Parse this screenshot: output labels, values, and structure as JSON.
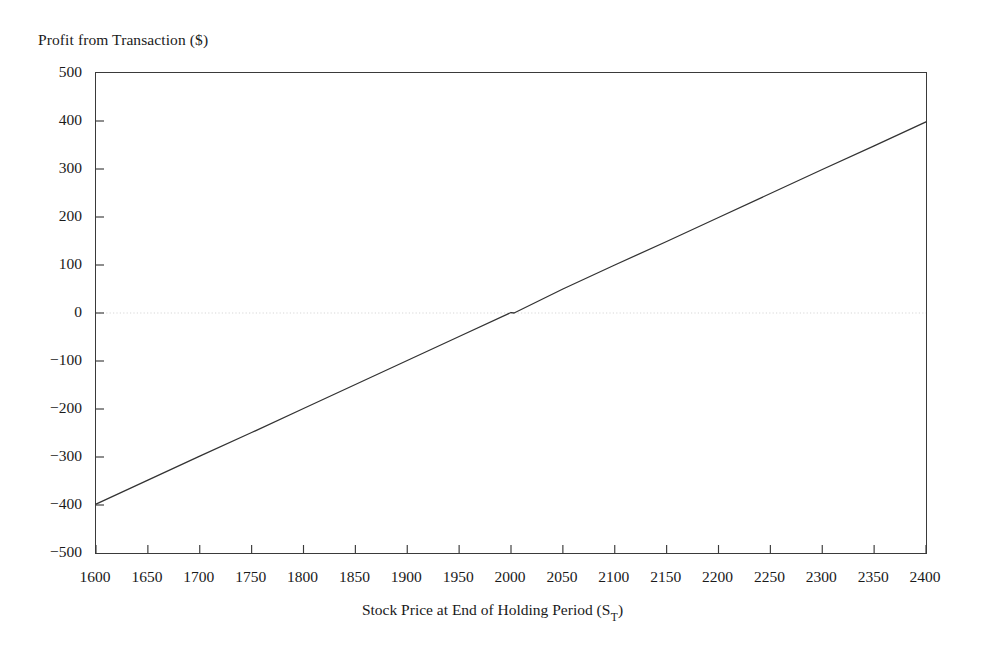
{
  "chart_data": {
    "type": "line",
    "title": "",
    "ylabel": "Profit from Transaction ($)",
    "xlabel_prefix": "Stock Price at End of Holding Period (S",
    "xlabel_subscript": "T",
    "xlabel_suffix": ")",
    "xlabel_full": "Stock Price at End of Holding Period (S_T)",
    "xlim": [
      1600,
      2400
    ],
    "ylim": [
      -500,
      500
    ],
    "xticks": [
      1600,
      1650,
      1700,
      1750,
      1800,
      1850,
      1900,
      1950,
      2000,
      2050,
      2100,
      2150,
      2200,
      2250,
      2300,
      2350,
      2400
    ],
    "yticks": [
      500,
      400,
      300,
      200,
      100,
      0,
      -100,
      -200,
      -300,
      -400,
      -500
    ],
    "ytick_labels": [
      "500",
      "400",
      "300",
      "200",
      "100",
      "0",
      "−100",
      "−200",
      "−300",
      "−400",
      "−500"
    ],
    "xtick_labels": [
      "1600",
      "1650",
      "1700",
      "1750",
      "1800",
      "1850",
      "1900",
      "1950",
      "2000",
      "2050",
      "2100",
      "2150",
      "2200",
      "2250",
      "2300",
      "2350",
      "2400"
    ],
    "grid": false,
    "zero_line": true,
    "zero_line_style": "dotted",
    "zero_line_color": "#d8d8d8",
    "legend": null,
    "series": [
      {
        "name": "Profit from Transaction",
        "color": "#333333",
        "linewidth": 1.3,
        "x": [
          1600,
          1650,
          1700,
          1750,
          1800,
          1850,
          1900,
          1950,
          2000,
          2003,
          2050,
          2100,
          2150,
          2200,
          2250,
          2300,
          2350,
          2400
        ],
        "values": [
          -398,
          -348,
          -298,
          -249,
          -199,
          -149,
          -99,
          -49,
          1,
          0,
          50,
          100,
          149,
          199,
          249,
          299,
          348,
          398
        ]
      }
    ],
    "breakeven_x": 2003,
    "slope_per_unit": 0.995,
    "axis_color": "#3a3a3a",
    "tick_direction": "in",
    "tick_length": 8
  },
  "figure": {
    "background": "#ffffff",
    "text_color": "#1a1a1a"
  }
}
